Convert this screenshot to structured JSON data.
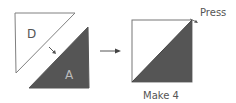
{
  "diagram": {
    "left_piece_white_label": "D",
    "left_piece_dark_label": "A",
    "press_label": "Press",
    "caption": "Make 4",
    "colors": {
      "dark_fill": "#555555",
      "outline": "#777777",
      "background": "#ffffff"
    }
  }
}
